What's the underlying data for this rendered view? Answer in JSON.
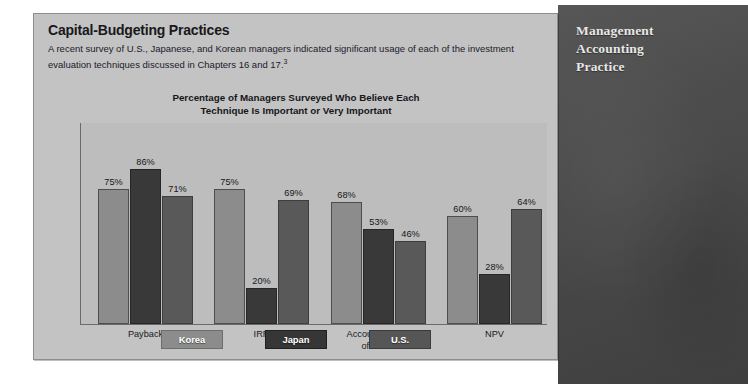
{
  "panel": {
    "title": "Capital-Budgeting Practices",
    "description_line1": "A recent survey of U.S., Japanese, and Korean managers indicated significant usage of each of the investment",
    "description_line2": "evaluation techniques discussed in Chapters 16 and 17.",
    "footnote_marker": "3"
  },
  "sidebar": {
    "title_line1": "Management",
    "title_line2": "Accounting",
    "title_line3": "Practice",
    "vertical_label": "M.A.P.",
    "background_color": "#4a4a4a"
  },
  "chart_data": {
    "type": "bar",
    "title": "Percentage of Managers Surveyed Who Believe Each Technique Is Important or Very Important",
    "title_line1": "Percentage of Managers Surveyed Who Believe Each",
    "title_line2": "Technique Is Important or Very Important",
    "xlabel": "",
    "ylabel": "",
    "ylim": [
      0,
      100
    ],
    "grid": false,
    "legend_position": "bottom",
    "categories": [
      "Payback",
      "IRR",
      "Accounting rate of return",
      "NPV"
    ],
    "category_lines": [
      [
        "Payback"
      ],
      [
        "IRR"
      ],
      [
        "Accounting rate",
        "of return"
      ],
      [
        "NPV"
      ]
    ],
    "series": [
      {
        "name": "Korea",
        "color": "#8c8c8c",
        "values": [
          75,
          75,
          68,
          60
        ],
        "labels": [
          "75%",
          "75%",
          "68%",
          "60%"
        ]
      },
      {
        "name": "Japan",
        "color": "#393939",
        "values": [
          86,
          20,
          53,
          28
        ],
        "labels": [
          "86%",
          "20%",
          "53%",
          "28%"
        ]
      },
      {
        "name": "U.S.",
        "color": "#595959",
        "values": [
          71,
          69,
          46,
          64
        ],
        "labels": [
          "71%",
          "69%",
          "46%",
          "64%"
        ]
      }
    ]
  },
  "legend": [
    {
      "label": "Korea",
      "color": "#8c8c8c"
    },
    {
      "label": "Japan",
      "color": "#393939"
    },
    {
      "label": "U.S.",
      "color": "#565656"
    }
  ]
}
